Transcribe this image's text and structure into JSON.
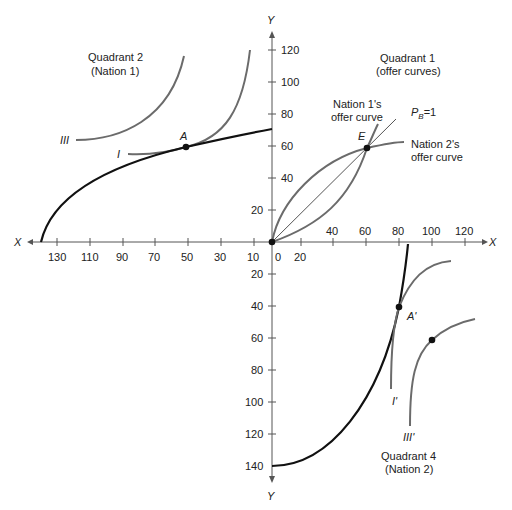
{
  "figure": {
    "type": "four-quadrant trade diagram",
    "axes": {
      "x_label_right": "X",
      "x_label_left": "X",
      "y_label_top": "Y",
      "y_label_bottom": "Y",
      "x_ticks_right": [
        "0",
        "20",
        "40",
        "60",
        "80",
        "100",
        "120"
      ],
      "x_ticks_left": [
        "130",
        "110",
        "90",
        "70",
        "50",
        "30",
        "10"
      ],
      "y_ticks_up": [
        "20",
        "40",
        "60",
        "80",
        "100",
        "120"
      ],
      "y_ticks_down": [
        "20",
        "40",
        "60",
        "80",
        "100",
        "120",
        "140"
      ]
    },
    "quadrant1": {
      "title": "Quadrant 1",
      "subtitle": "(offer curves)",
      "nation1_label_line1": "Nation 1's",
      "nation1_label_line2": "offer curve",
      "nation2_label_line1": "Nation 2's",
      "nation2_label_line2": "offer curve",
      "price_line_label_p": "P",
      "price_line_label_sub": "B",
      "price_line_label_eq": "=1",
      "equilibrium_label": "E",
      "equilibrium_point": {
        "x": 60,
        "y": 60
      }
    },
    "quadrant2": {
      "title": "Quadrant 2",
      "subtitle": "(Nation 1)",
      "indiff_low_label": "I",
      "indiff_high_label": "III",
      "point_label": "A",
      "point": {
        "x": 50,
        "y": 60
      }
    },
    "quadrant4": {
      "title": "Quadrant 4",
      "subtitle": "(Nation 2)",
      "indiff_low_label": "I'",
      "indiff_high_label": "III'",
      "point_label": "A'",
      "point": {
        "x": 80,
        "y": 40
      }
    }
  },
  "colors": {
    "production_frontier": "#111111",
    "curves": "#6b6b6b",
    "axes": "#555555"
  }
}
